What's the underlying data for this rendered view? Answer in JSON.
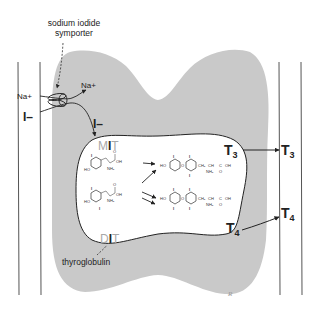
{
  "diagram": {
    "labels": {
      "symporter": [
        "sodium iodide",
        "symporter"
      ],
      "na_outside": "Na+",
      "na_inside": "Na+",
      "iodide_outside": "I–",
      "iodide_inside": "I–",
      "mit": {
        "pre": "M",
        "mid": "I",
        "post": "T"
      },
      "dit": {
        "pre": "D",
        "mid": "I",
        "post": "T"
      },
      "thyroglobulin": "thyroglobulin",
      "t3_inside": "T",
      "t3_inside_sub": "3",
      "t3_outside": "T",
      "t3_outside_sub": "3",
      "t4_inside": "T",
      "t4_inside_sub": "4",
      "t4_outside": "T",
      "t4_outside_sub": "4",
      "signature": "R"
    },
    "chem": {
      "ho": "HO",
      "oh": "OH",
      "nh2": "NH₂",
      "o": "O",
      "i": "I",
      "ch2": "CH₂",
      "ch": "CH",
      "c": "C"
    },
    "colors": {
      "cell": "#c9c9c9",
      "colloid": "#ffffff",
      "outline": "#222222",
      "faded_text": "#a8a8a8"
    }
  }
}
